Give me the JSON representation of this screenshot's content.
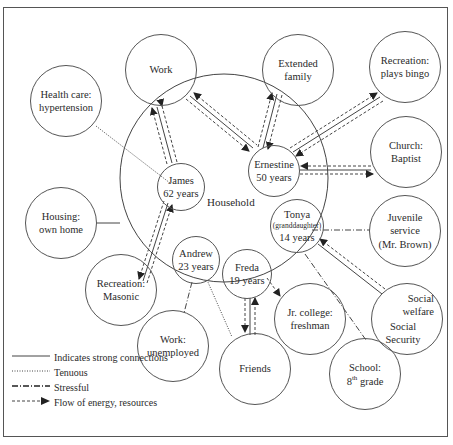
{
  "household": {
    "label": "Household",
    "members": [
      {
        "id": "james",
        "name": "James",
        "detail": "62 years"
      },
      {
        "id": "ernestine",
        "name": "Ernestine",
        "detail": "50 years"
      },
      {
        "id": "tonya",
        "name": "Tonya",
        "note": "(granddaughter)",
        "detail": "14 years"
      },
      {
        "id": "andrew",
        "name": "Andrew",
        "detail": "23 years"
      },
      {
        "id": "freda",
        "name": "Freda",
        "detail": "19 years"
      }
    ]
  },
  "external_systems": [
    {
      "id": "work",
      "line1": "Work",
      "line2": ""
    },
    {
      "id": "health",
      "line1": "Health care:",
      "line2": "hypertension"
    },
    {
      "id": "extended",
      "line1": "Extended",
      "line2": "family"
    },
    {
      "id": "bingo",
      "line1": "Recreation:",
      "line2": "plays bingo"
    },
    {
      "id": "church",
      "line1": "Church:",
      "line2": "Baptist"
    },
    {
      "id": "housing",
      "line1": "Housing:",
      "line2": "own home"
    },
    {
      "id": "juvenile",
      "line1": "Juvenile",
      "line2": "service",
      "line3": "(Mr. Brown)"
    },
    {
      "id": "masonic",
      "line1": "Recreation:",
      "line2": "Masonic"
    },
    {
      "id": "social",
      "line1": "Social",
      "line2": "welfare",
      "line3": "Social",
      "line4": "Security"
    },
    {
      "id": "jrcollege",
      "line1": "Jr. college:",
      "line2": "freshman"
    },
    {
      "id": "unemployed",
      "line1": "Work:",
      "line2": "unemployed"
    },
    {
      "id": "friends",
      "line1": "Friends",
      "line2": ""
    },
    {
      "id": "school",
      "line1": "School:",
      "line2_pre": "8",
      "line2_sup": "th",
      "line2_post": " grade"
    }
  ],
  "connections": [
    {
      "from": "james",
      "to": "work",
      "type": "strong+flow",
      "direction": "both"
    },
    {
      "from": "ernestine",
      "to": "work",
      "type": "strong+flow",
      "direction": "both"
    },
    {
      "from": "james",
      "to": "health",
      "type": "tenuous"
    },
    {
      "from": "ernestine",
      "to": "extended",
      "type": "strong+flow",
      "direction": "both"
    },
    {
      "from": "ernestine",
      "to": "bingo",
      "type": "strong+flow",
      "direction": "both"
    },
    {
      "from": "ernestine",
      "to": "church",
      "type": "strong+flow",
      "direction": "both"
    },
    {
      "from": "household",
      "to": "housing",
      "type": "strong"
    },
    {
      "from": "james",
      "to": "masonic",
      "type": "strong+flow",
      "direction": "both"
    },
    {
      "from": "tonya",
      "to": "juvenile",
      "type": "stressful"
    },
    {
      "from": "tonya",
      "to": "social",
      "type": "strong+flow",
      "direction": "to-tonya"
    },
    {
      "from": "tonya",
      "to": "school",
      "type": "stressful"
    },
    {
      "from": "freda",
      "to": "jrcollege",
      "type": "flow",
      "direction": "to-jrcollege"
    },
    {
      "from": "freda",
      "to": "friends",
      "type": "strong+flow",
      "direction": "both"
    },
    {
      "from": "andrew",
      "to": "unemployed",
      "type": "stressful"
    },
    {
      "from": "andrew",
      "to": "friends",
      "type": "tenuous"
    }
  ],
  "legend": [
    {
      "style": "solid",
      "label": "Indicates strong connections"
    },
    {
      "style": "dotted",
      "label": "Tenuous"
    },
    {
      "style": "dashdot",
      "label": "Stressful"
    },
    {
      "style": "dashed-arrow",
      "label": "Flow of energy, resources"
    }
  ],
  "colors": {
    "line": "#444444",
    "border": "#555555",
    "background": "#ffffff"
  }
}
